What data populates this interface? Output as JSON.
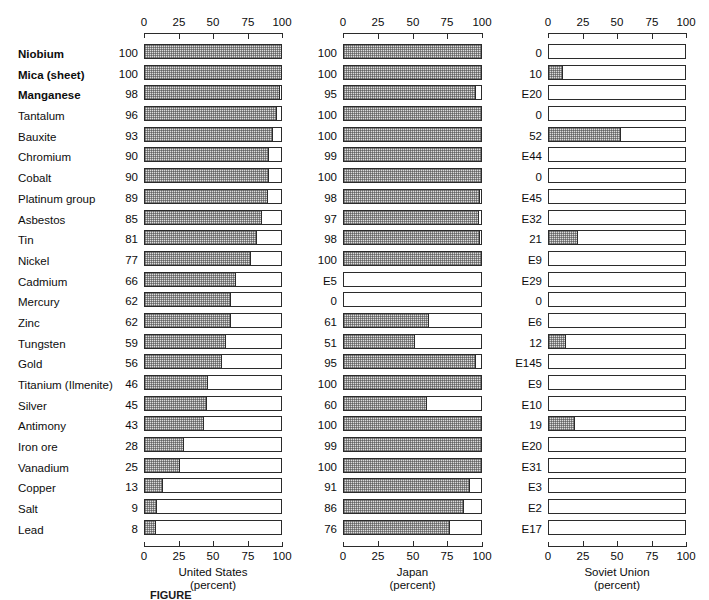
{
  "chart_data": {
    "type": "bar",
    "title": "",
    "xlabel": "percent",
    "ylabel": "",
    "xlim": [
      0,
      100
    ],
    "ticks": [
      "0",
      "25",
      "50",
      "75",
      "100"
    ],
    "grid": false,
    "legend": "none",
    "orientation": "horizontal",
    "note": "Three side-by-side horizontal bar panels; each row is a mineral commodity. Values prefixed with 'E' are estimates and are drawn as empty (unfilled) bars.",
    "categories": [
      "Niobium",
      "Mica (sheet)",
      "Manganese",
      "Tantalum",
      "Bauxite",
      "Chromium",
      "Cobalt",
      "Platinum group",
      "Asbestos",
      "Tin",
      "Nickel",
      "Cadmium",
      "Mercury",
      "Zinc",
      "Tungsten",
      "Gold",
      "Titanium (Ilmenite)",
      "Silver",
      "Antimony",
      "Iron ore",
      "Vanadium",
      "Copper",
      "Salt",
      "Lead"
    ],
    "category_bold": [
      true,
      true,
      true,
      false,
      false,
      false,
      false,
      false,
      false,
      false,
      false,
      false,
      false,
      false,
      false,
      false,
      false,
      false,
      false,
      false,
      false,
      false,
      false,
      false
    ],
    "series": [
      {
        "name": "United States",
        "unit": "percent",
        "caption_line1": "United States",
        "caption_line2": "(percent)",
        "labels": [
          "100",
          "100",
          "98",
          "96",
          "93",
          "90",
          "90",
          "89",
          "85",
          "81",
          "77",
          "66",
          "62",
          "62",
          "59",
          "56",
          "46",
          "45",
          "43",
          "28",
          "25",
          "13",
          "9",
          "8"
        ],
        "values": [
          100,
          100,
          98,
          96,
          93,
          90,
          90,
          89,
          85,
          81,
          77,
          66,
          62,
          62,
          59,
          56,
          46,
          45,
          43,
          28,
          25,
          13,
          9,
          8
        ],
        "estimated": [
          false,
          false,
          false,
          false,
          false,
          false,
          false,
          false,
          false,
          false,
          false,
          false,
          false,
          false,
          false,
          false,
          false,
          false,
          false,
          false,
          false,
          false,
          false,
          false
        ]
      },
      {
        "name": "Japan",
        "unit": "percent",
        "caption_line1": "Japan",
        "caption_line2": "(percent)",
        "labels": [
          "100",
          "100",
          "95",
          "100",
          "100",
          "99",
          "100",
          "98",
          "97",
          "98",
          "100",
          "E5",
          "0",
          "61",
          "51",
          "95",
          "100",
          "60",
          "100",
          "99",
          "100",
          "91",
          "86",
          "76"
        ],
        "values": [
          100,
          100,
          95,
          100,
          100,
          99,
          100,
          98,
          97,
          98,
          100,
          5,
          0,
          61,
          51,
          95,
          100,
          60,
          100,
          99,
          100,
          91,
          86,
          76
        ],
        "estimated": [
          false,
          false,
          false,
          false,
          false,
          false,
          false,
          false,
          false,
          false,
          false,
          true,
          false,
          false,
          false,
          false,
          false,
          false,
          false,
          false,
          false,
          false,
          false,
          false
        ]
      },
      {
        "name": "Soviet Union",
        "unit": "percent",
        "caption_line1": "Soviet Union",
        "caption_line2": "(percent)",
        "labels": [
          "0",
          "10",
          "E20",
          "0",
          "52",
          "E44",
          "0",
          "E45",
          "E32",
          "21",
          "E9",
          "E29",
          "0",
          "E6",
          "12",
          "E145",
          "E9",
          "E10",
          "19",
          "E20",
          "E31",
          "E3",
          "E2",
          "E17"
        ],
        "values": [
          0,
          10,
          20,
          0,
          52,
          44,
          0,
          45,
          32,
          21,
          9,
          29,
          0,
          6,
          12,
          145,
          9,
          10,
          19,
          20,
          31,
          3,
          2,
          17
        ],
        "estimated": [
          false,
          false,
          true,
          false,
          false,
          true,
          false,
          true,
          true,
          false,
          true,
          true,
          false,
          true,
          false,
          true,
          true,
          true,
          false,
          true,
          true,
          true,
          true,
          true
        ]
      }
    ]
  },
  "figure": {
    "caption": "FIGURE"
  }
}
